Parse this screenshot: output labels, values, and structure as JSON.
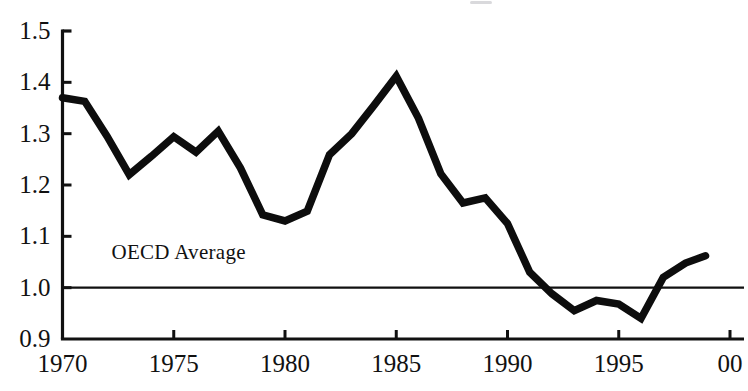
{
  "chart_data": {
    "type": "line",
    "title": "",
    "subtitle": "",
    "xlabel": "",
    "ylabel": "",
    "xlim": [
      1970,
      2000
    ],
    "ylim": [
      0.9,
      1.5
    ],
    "grid": false,
    "legend": "none",
    "x_tick_labels": [
      "1970",
      "1975",
      "1980",
      "1985",
      "1990",
      "1995",
      "00"
    ],
    "x_tick_values": [
      1970,
      1975,
      1980,
      1985,
      1990,
      1995,
      2000
    ],
    "y_tick_labels": [
      "1.5",
      "1.4",
      "1.3",
      "1.2",
      "1.1",
      "1.0",
      "0.9"
    ],
    "y_tick_values": [
      1.5,
      1.4,
      1.3,
      1.2,
      1.1,
      1.0,
      0.9
    ],
    "annotations": [
      {
        "text": "OECD Average",
        "x": 1972.2,
        "y": 1.065,
        "name": "oecd-average-label"
      }
    ],
    "reference_lines": [
      {
        "name": "oecd-average-line",
        "orientation": "horizontal",
        "value": 1.0,
        "color": "#111111",
        "width": 2.2,
        "x_from": 1970,
        "x_to": 2000
      }
    ],
    "series": [
      {
        "name": "relative-level",
        "color": "#0d0d0d",
        "width": 7.5,
        "x": [
          1970,
          1971,
          1972,
          1973,
          1974,
          1975,
          1976,
          1977,
          1978,
          1979,
          1980,
          1981,
          1982,
          1983,
          1984,
          1985,
          1986,
          1987,
          1988,
          1989,
          1990,
          1991,
          1992,
          1993,
          1994,
          1995,
          1996,
          1997,
          1998
        ],
        "values": [
          1.37,
          1.363,
          1.295,
          1.22,
          1.256,
          1.294,
          1.264,
          1.305,
          1.233,
          1.142,
          1.13,
          1.149,
          1.259,
          1.3,
          1.355,
          1.412,
          1.33,
          1.222,
          1.165,
          1.175,
          1.125,
          1.03,
          0.988,
          0.955,
          0.975,
          0.968,
          0.94,
          1.02,
          1.048
        ],
        "end_extension": {
          "x": 1998.9,
          "y": 1.062
        }
      }
    ]
  },
  "axes": {
    "y_axis_name": "y-axis",
    "x_axis_name": "x-axis",
    "axis_color": "#111111",
    "tick_length": 9,
    "axis_width": 3.2
  },
  "colors": {
    "background": "#ffffff",
    "ink": "#111111",
    "series": "#0d0d0d"
  }
}
